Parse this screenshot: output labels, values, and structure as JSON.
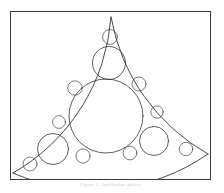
{
  "figure": {
    "title": "Apollonian gasket",
    "caption": "Figure 1.  Apollonian gasket",
    "frame": {
      "x": 10,
      "y": 11,
      "width": 201,
      "height": 169,
      "border_color": "#3b3b3b",
      "background_color": "#ffffff"
    },
    "stroke_color": "#2a2a2a",
    "fill_color": "#ffffff"
  },
  "chart_data": {
    "type": "diagram",
    "title": "Apollonian gasket",
    "subtitle": "",
    "xlabel": "",
    "ylabel": "",
    "grid": false,
    "legend": "none",
    "coordinate_space": {
      "width": 201,
      "height": 169,
      "origin": "top-left of frame interior"
    },
    "outer_boundary_arcs": [
      {
        "name": "left-arc",
        "cx": 195.0,
        "cy": 26.0,
        "r": 195.0,
        "note": "arc from top apex down to bottom-left apex"
      },
      {
        "name": "right-arc",
        "cx": 6.0,
        "cy": 34.0,
        "r": 196.0,
        "note": "arc from top apex down to bottom-right apex"
      },
      {
        "name": "bottom-arc",
        "cx": 98.0,
        "cy": -36.0,
        "r": 200.0,
        "note": "shallow arc from bottom-left apex to bottom-right apex"
      }
    ],
    "apexes": [
      {
        "name": "top-apex",
        "x": 100,
        "y": 5
      },
      {
        "name": "left-apex",
        "x": 2,
        "y": 161
      },
      {
        "name": "right-apex",
        "x": 197,
        "y": 142
      }
    ],
    "circles": [
      {
        "id": 1,
        "cx": 95,
        "cy": 104,
        "r": 37,
        "generation": 1,
        "label": "central"
      },
      {
        "id": 2,
        "cx": 98,
        "cy": 51,
        "r": 16.5,
        "generation": 2,
        "label": "top"
      },
      {
        "id": 3,
        "cx": 42,
        "cy": 137,
        "r": 15.5,
        "generation": 2,
        "label": "lower-left"
      },
      {
        "id": 4,
        "cx": 143,
        "cy": 129,
        "r": 14.5,
        "generation": 2,
        "label": "lower-right"
      },
      {
        "id": 5,
        "cx": 99,
        "cy": 25,
        "r": 7.4,
        "generation": 3
      },
      {
        "id": 6,
        "cx": 19,
        "cy": 152,
        "r": 7.0,
        "generation": 3
      },
      {
        "id": 7,
        "cx": 175,
        "cy": 137,
        "r": 6.7,
        "generation": 3
      },
      {
        "id": 8,
        "cx": 64,
        "cy": 76,
        "r": 7.2,
        "generation": 3
      },
      {
        "id": 9,
        "cx": 128,
        "cy": 72,
        "r": 7.0,
        "generation": 3
      },
      {
        "id": 10,
        "cx": 72,
        "cy": 144,
        "r": 7.1,
        "generation": 3
      },
      {
        "id": 11,
        "cx": 119,
        "cy": 141,
        "r": 6.9,
        "generation": 3
      },
      {
        "id": 12,
        "cx": 48,
        "cy": 110,
        "r": 6.4,
        "generation": 3
      },
      {
        "id": 13,
        "cx": 146,
        "cy": 100,
        "r": 6.2,
        "generation": 3
      }
    ],
    "fractal_levels": 7,
    "symmetry": "three-fold rotational"
  }
}
